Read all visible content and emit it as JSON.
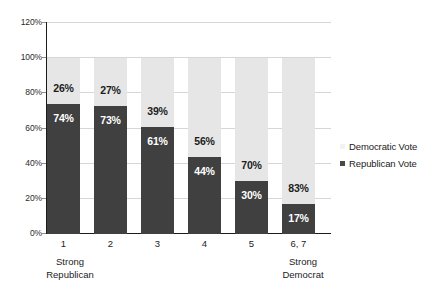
{
  "chart_data": {
    "type": "bar",
    "subtype": "stacked-100-percent",
    "title": "",
    "subtitle": "",
    "xlabel": "",
    "ylabel": "",
    "ylim": [
      0,
      120
    ],
    "ytick_labels": [
      "0%",
      "20%",
      "40%",
      "60%",
      "80%",
      "100%",
      "120%"
    ],
    "ytick_values": [
      0,
      20,
      40,
      60,
      80,
      100,
      120
    ],
    "grid": true,
    "grid_axis": "y",
    "legend_position": "right",
    "categories": [
      "1",
      "2",
      "3",
      "4",
      "5",
      "6, 7"
    ],
    "category_endcap_low": "Strong\nRepublican",
    "category_endcap_high": "Strong\nDemocrat",
    "series": [
      {
        "name": "Democratic Vote",
        "color": "#e6e6e6",
        "values": [
          26,
          27,
          39,
          56,
          70,
          83
        ],
        "labels": [
          "26%",
          "27%",
          "39%",
          "56%",
          "70%",
          "83%"
        ]
      },
      {
        "name": "Republican Vote",
        "color": "#404040",
        "values": [
          74,
          73,
          61,
          44,
          30,
          17
        ],
        "labels": [
          "74%",
          "73%",
          "61%",
          "44%",
          "30%",
          "17%"
        ]
      }
    ]
  },
  "axis": {
    "y_ticks": [
      {
        "label": "120%",
        "value": 120
      },
      {
        "label": "100%",
        "value": 100
      },
      {
        "label": "80%",
        "value": 80
      },
      {
        "label": "60%",
        "value": 60
      },
      {
        "label": "40%",
        "value": 40
      },
      {
        "label": "20%",
        "value": 20
      },
      {
        "label": "0%",
        "value": 0
      }
    ],
    "x_ticks": [
      {
        "label": "1"
      },
      {
        "label": "2"
      },
      {
        "label": "3"
      },
      {
        "label": "4"
      },
      {
        "label": "5"
      },
      {
        "label": "6, 7"
      }
    ],
    "endcaps": {
      "left_line1": "Strong",
      "left_line2": "Republican",
      "right_line1": "Strong",
      "right_line2": "Democrat"
    }
  },
  "legend": {
    "items": [
      {
        "label": "Democratic Vote",
        "color": "#f2f2f2",
        "swatch_class": "dem"
      },
      {
        "label": "Republican Vote",
        "color": "#4a4a4a",
        "swatch_class": "rep"
      }
    ]
  }
}
